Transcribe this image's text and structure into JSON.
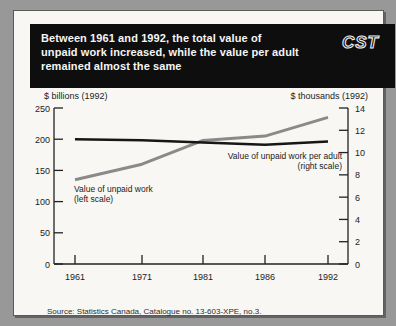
{
  "page": {
    "logo": "CST",
    "title_lines": [
      "Between 1961 and 1992, the total value of",
      "unpaid work increased, while the value per adult",
      "remained almost the same"
    ],
    "source": "Source: Statistics Canada, Catalogue no. 13-603-XPE, no.3."
  },
  "colors": {
    "frame": "#989898",
    "card": "#f8f7f3",
    "banner": "#0e0e0e",
    "banner_text": "#f5f5f5",
    "axis": "#222222",
    "text": "#1c1c1c"
  },
  "chart_data": {
    "type": "line",
    "categories": [
      "1961",
      "1971",
      "1981",
      "1986",
      "1992"
    ],
    "series": [
      {
        "name": "Value of unpaid work",
        "scale": "left",
        "color": "#8a8a8a",
        "label_lines": [
          "Value of unpaid work",
          "(left scale)"
        ],
        "values": [
          135,
          160,
          198,
          205,
          235
        ]
      },
      {
        "name": "Value of unpaid work per adult",
        "scale": "right",
        "color": "#161616",
        "label_lines": [
          "Value of unpaid work per adult",
          "(right scale)"
        ],
        "values": [
          11.2,
          11.1,
          10.9,
          10.7,
          11.0
        ]
      }
    ],
    "left_axis": {
      "label": "$ billions (1992)",
      "ticks": [
        0,
        50,
        100,
        150,
        200,
        250
      ],
      "range": [
        0,
        250
      ]
    },
    "right_axis": {
      "label": "$ thousands (1992)",
      "ticks": [
        0,
        2,
        4,
        6,
        8,
        10,
        12,
        14
      ],
      "range": [
        0,
        14
      ]
    },
    "grid": false,
    "legend_position": "inline-annotations"
  }
}
